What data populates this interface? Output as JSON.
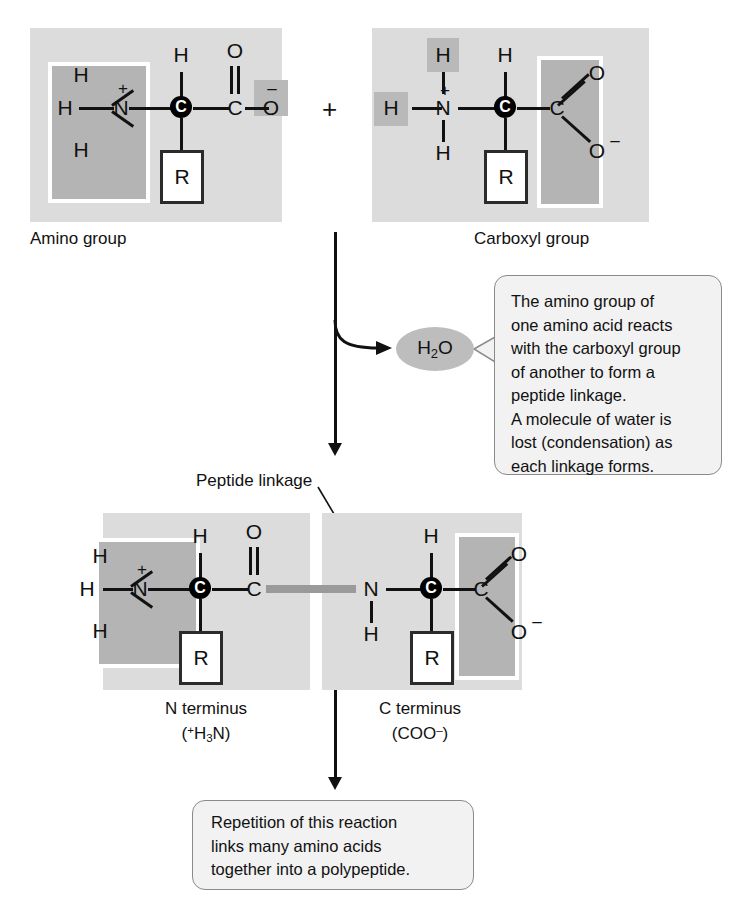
{
  "figure": {
    "type": "biochemistry-reaction-diagram"
  },
  "reactant_left": {
    "label": "Amino group",
    "highlight_note": "amino group boxed (dark) and carboxylate O minus lightly shaded",
    "atoms": {
      "h_top_left": "H",
      "h_left": "H",
      "h_bottom_left": "H",
      "n": "N",
      "n_charge": "+",
      "h_alpha": "H",
      "alpha_carbon": "C",
      "carbonyl_c": "C",
      "carbonyl_o": "O",
      "hydroxyl_o": "O",
      "o_charge": "–",
      "r_group": "R"
    }
  },
  "plus_operator": "+",
  "reactant_right": {
    "label": "Carboxyl group",
    "highlight_note": "carboxyl group boxed (dark); two hydrogens lightly shaded",
    "atoms": {
      "h_top": "H",
      "h_left": "H",
      "n": "N",
      "n_charge": "+",
      "h_bottom": "H",
      "h_alpha": "H",
      "alpha_carbon": "C",
      "carboxyl_c": "C",
      "carbonyl_o": "O",
      "hydroxyl_o": "O",
      "o_charge": "–",
      "r_group": "R"
    }
  },
  "water": {
    "formula_text": "H2O",
    "formula_parts": {
      "h": "H",
      "count": "2",
      "o": "O"
    }
  },
  "callout_top": {
    "lines": [
      "The amino group of",
      "one amino acid reacts",
      "with the carboxyl group",
      "of another to form a",
      "peptide linkage.",
      "A molecule of water is",
      "lost (condensation) as",
      "each linkage forms."
    ]
  },
  "peptide_linkage_label": "Peptide linkage",
  "product": {
    "left_terminus_label": "N terminus",
    "left_terminus_formula": "(⁺H₃N)",
    "left_terminus_formula_parts": {
      "open": "(",
      "charge": "+",
      "h": "H",
      "count": "3",
      "n": "N",
      "close": ")"
    },
    "right_terminus_label": "C terminus",
    "right_terminus_formula": "(COO⁻)",
    "right_terminus_formula_parts": {
      "open": "(C",
      "oo": "OO",
      "charge": "–",
      "close": ")"
    },
    "left_residue_atoms": {
      "h_top_left": "H",
      "h_left": "H",
      "h_bottom_left": "H",
      "n": "N",
      "n_charge": "+",
      "h_alpha": "H",
      "alpha_carbon": "C",
      "carbonyl_c": "C",
      "carbonyl_o": "O",
      "r_group": "R"
    },
    "right_residue_atoms": {
      "amide_n": "N",
      "amide_h": "H",
      "h_alpha": "H",
      "alpha_carbon": "C",
      "carboxyl_c": "C",
      "carbonyl_o": "O",
      "hydroxyl_o": "O",
      "o_charge": "–",
      "r_group": "R"
    }
  },
  "callout_bottom": {
    "lines": [
      "Repetition of this reaction",
      "links many amino acids",
      "together into a polypeptide."
    ]
  },
  "colors": {
    "panel_background": "#dcdcdc",
    "inner_box_background": "#b4b4b4",
    "highlight_background": "#b9b9b9",
    "peptide_bond": "#9a9a9a",
    "callout_background": "#f2f2f2",
    "callout_border": "#8a8a8a",
    "water_ellipse": "#bdbdbd",
    "ink": "#111111"
  }
}
